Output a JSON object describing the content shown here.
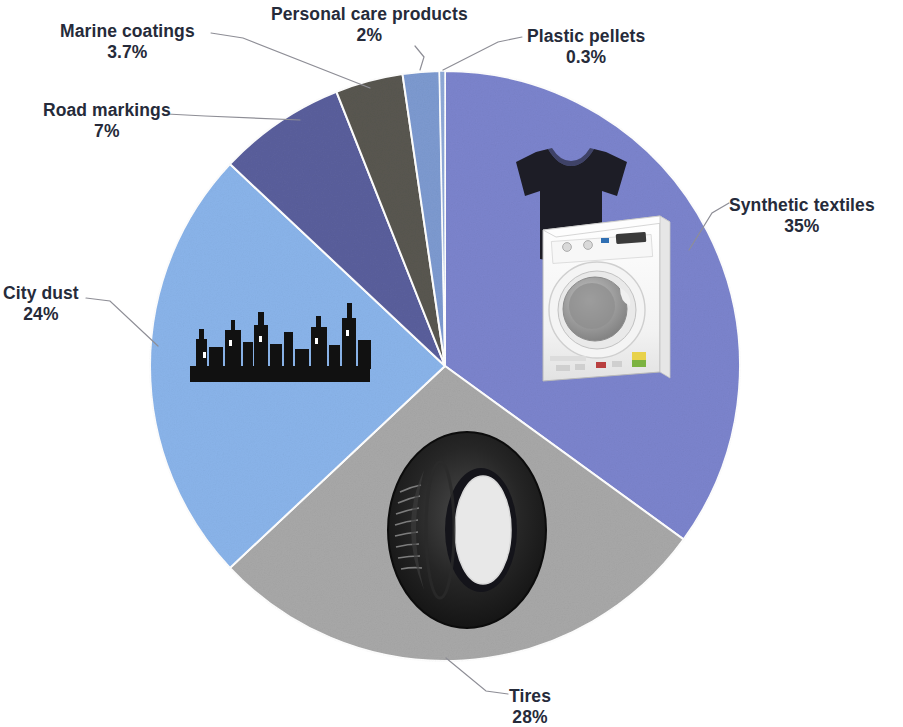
{
  "figure": {
    "background_color": "#ffffff",
    "label_text_color": "#262b3a",
    "leader_line_color": "#8e8e96"
  },
  "chart_data": {
    "type": "pie",
    "title": "",
    "subtitle": "",
    "xlabel": "",
    "ylabel": "",
    "legend_position": "none",
    "grid": false,
    "total": 100,
    "unit": "%",
    "start_angle_deg": 0,
    "direction": "clockwise",
    "categories": [
      "Synthetic textiles",
      "Tires",
      "City dust",
      "Road markings",
      "Marine coatings",
      "Personal care products",
      "Plastic pellets"
    ],
    "values": [
      35,
      28,
      24,
      7,
      3.7,
      2,
      0.3
    ],
    "value_labels": [
      "35%",
      "28%",
      "24%",
      "7%",
      "3.7%",
      "2%",
      "0.3%"
    ],
    "colors": [
      "#7c84cd",
      "#a8a8a8",
      "#8ab4ea",
      "#5a5f9c",
      "#595750",
      "#7d9ad0",
      "#8fa9d8"
    ],
    "slices": [
      {
        "name": "Synthetic textiles",
        "label": "Synthetic textiles",
        "value": 35,
        "value_label": "35%",
        "color": "#7c84cd",
        "icon": "tshirt-and-washing-machine-icon"
      },
      {
        "name": "Tires",
        "label": "Tires",
        "value": 28,
        "value_label": "28%",
        "color": "#a8a8a8",
        "icon": "tire-icon"
      },
      {
        "name": "City dust",
        "label": "City dust",
        "value": 24,
        "value_label": "24%",
        "color": "#8ab4ea",
        "icon": "city-skyline-icon"
      },
      {
        "name": "Road markings",
        "label": "Road markings",
        "value": 7,
        "value_label": "7%",
        "color": "#5a5f9c",
        "icon": ""
      },
      {
        "name": "Marine coatings",
        "label": "Marine coatings",
        "value": 3.7,
        "value_label": "3.7%",
        "color": "#595750",
        "icon": ""
      },
      {
        "name": "Personal care products",
        "label": "Personal care products",
        "value": 2,
        "value_label": "2%",
        "color": "#7d9ad0",
        "icon": ""
      },
      {
        "name": "Plastic pellets",
        "label": "Plastic pellets",
        "value": 0.3,
        "value_label": "0.3%",
        "color": "#8fa9d8",
        "icon": ""
      }
    ]
  }
}
